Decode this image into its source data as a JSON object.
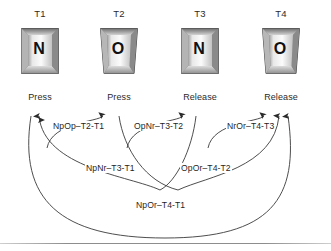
{
  "figure": {
    "background_color": "#ffffff",
    "line_color": "#3a3a3a",
    "text_color": "#1f1f1f"
  },
  "timeline": {
    "columns": [
      {
        "time_label": "T1",
        "key_glyph": "N",
        "event_label": "Press",
        "x": 40
      },
      {
        "time_label": "T2",
        "key_glyph": "O",
        "event_label": "Press",
        "x": 119
      },
      {
        "time_label": "T3",
        "key_glyph": "N",
        "event_label": "Release",
        "x": 200
      },
      {
        "time_label": "T4",
        "key_glyph": "O",
        "event_label": "Release",
        "x": 281
      }
    ]
  },
  "features": {
    "row_top": [
      {
        "label": "NpOp–T2-T1",
        "from": "T1",
        "to": "T2"
      },
      {
        "label": "OpNr–T3-T2",
        "from": "T2",
        "to": "T3"
      },
      {
        "label": "NrOr–T4-T3",
        "from": "T3",
        "to": "T4"
      }
    ],
    "row_middle": [
      {
        "label": "NpNr–T3-T1",
        "from": "T1",
        "to": "T3"
      },
      {
        "label": "OpOr–T4-T2",
        "from": "T2",
        "to": "T4"
      }
    ],
    "row_bottom": [
      {
        "label": "NpOr–T4-T1",
        "from": "T1",
        "to": "T4"
      }
    ]
  }
}
